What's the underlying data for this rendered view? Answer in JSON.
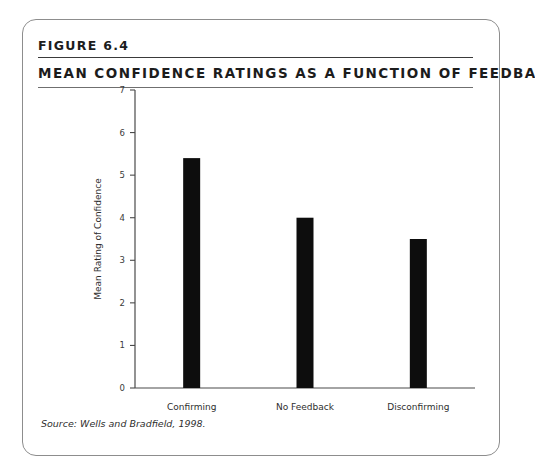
{
  "figure": {
    "number_label": "FIGURE 6.4",
    "title": "MEAN CONFIDENCE RATINGS AS A FUNCTION OF FEEDBACK",
    "source": "Source: Wells and Bradfield, 1998."
  },
  "chart_data": {
    "type": "bar",
    "title": "MEAN CONFIDENCE RATINGS AS A FUNCTION OF FEEDBACK",
    "categories": [
      "Confirming",
      "No Feedback",
      "Disconfirming"
    ],
    "values": [
      5.4,
      4.0,
      3.5
    ],
    "xlabel": "Type of Feedback",
    "ylabel": "Mean Rating of Confidence",
    "ylim": [
      0,
      7
    ],
    "yticks": [
      0,
      1,
      2,
      3,
      4,
      5,
      6,
      7
    ],
    "ytick_labels": [
      "0",
      "1",
      "2",
      "3",
      "4",
      "5",
      "6",
      "7"
    ],
    "grid": false,
    "legend": false,
    "bar_color": "#0d0d0d"
  },
  "colors": {
    "frame": "#8d8d8d",
    "rule": "#3a3a3a",
    "axis": "#4a4a4a",
    "text": "#1c1c1c",
    "bar": "#0d0d0d"
  }
}
